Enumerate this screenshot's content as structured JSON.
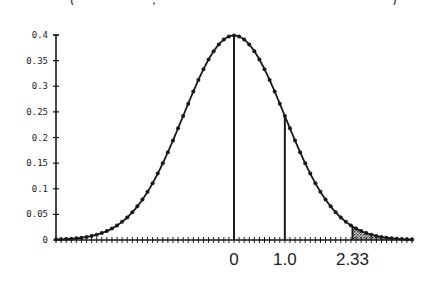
{
  "chart_data": {
    "type": "line",
    "title": "",
    "cropped_caption_fragments": [
      "(",
      ",",
      ")"
    ],
    "xlabel": "",
    "ylabel": "",
    "ylim": [
      0,
      0.4
    ],
    "xlim": [
      -3.5,
      3.5
    ],
    "yticks": [
      "0",
      "0.05",
      "0.1",
      "0.15",
      "0.2",
      "0.25",
      "0.3",
      "0.35",
      "0.4"
    ],
    "xtick_labels": [
      {
        "value": 0,
        "label": "0"
      },
      {
        "value": 1.0,
        "label": "1.0"
      },
      {
        "value": 2.33,
        "label": "2.33"
      }
    ],
    "series": [
      {
        "name": "standard normal density",
        "marker": "dot"
      }
    ],
    "vertical_lines": [
      {
        "x": 0,
        "y": 0.399
      },
      {
        "x": 1.0,
        "y": 0.242
      },
      {
        "x": 2.33,
        "y": 0.026
      }
    ],
    "shaded_region": {
      "from": 2.33,
      "to": 3.5,
      "pattern": "stipple"
    },
    "grid": false,
    "legend": null
  },
  "colors": {
    "line": "#1a1a1a",
    "shade": "#9a9a9a",
    "background": "#ffffff"
  }
}
